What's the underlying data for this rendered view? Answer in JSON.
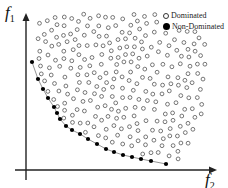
{
  "chart_data": {
    "type": "scatter",
    "title": "",
    "xlabel": "f2",
    "ylabel": "f1",
    "grid": false,
    "legend_position": "top-right",
    "legend": [
      {
        "label": "Dominated",
        "marker": "open-circle"
      },
      {
        "label": "Non-Dominated",
        "marker": "filled-circle"
      }
    ],
    "series": [
      {
        "name": "Non-Dominated",
        "marker": "filled-circle",
        "connected": true,
        "points_px": [
          [
            32,
            62
          ],
          [
            38,
            79
          ],
          [
            43,
            89
          ],
          [
            48,
            98
          ],
          [
            54,
            107
          ],
          [
            57,
            113
          ],
          [
            60,
            119
          ],
          [
            66,
            126
          ],
          [
            72,
            130
          ],
          [
            80,
            134
          ],
          [
            88,
            139
          ],
          [
            97,
            144
          ],
          [
            106,
            149
          ],
          [
            114,
            152
          ],
          [
            123,
            155
          ],
          [
            132,
            157
          ],
          [
            141,
            159
          ],
          [
            151,
            161
          ],
          [
            166,
            164
          ]
        ]
      },
      {
        "name": "Dominated",
        "marker": "open-circle",
        "connected": false,
        "region_px": "cloud above/right of front, x 40-205, y 15-162"
      }
    ]
  },
  "axes": {
    "x_label_main": "f",
    "x_label_sub": "2",
    "y_label_main": "f",
    "y_label_sub": "1"
  },
  "legend": {
    "dominated": "Dominated",
    "non_dominated": "Non-Dominated"
  }
}
